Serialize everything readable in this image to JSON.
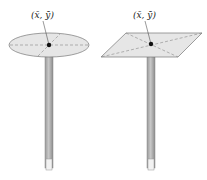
{
  "figures": [
    {
      "shape": "ellipse",
      "label": "(x̄, ȳ)",
      "description": "Elliptical plate balanced on pencil at centroid"
    },
    {
      "shape": "parallelogram",
      "label": "(x̄, ȳ)",
      "description": "Parallelogram plate balanced on pencil at centroid"
    }
  ],
  "colors": {
    "plate_fill": "#e6e6e6",
    "plate_stroke": "#777777",
    "pencil_body": "#b5b5b5",
    "pencil_dark": "#8e8e8e",
    "dot": "#111111"
  }
}
